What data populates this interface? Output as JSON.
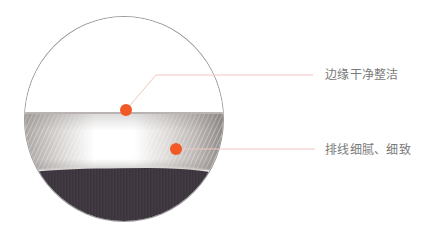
{
  "callouts": [
    {
      "label": "边缘干净整洁",
      "target": "lens-edge"
    },
    {
      "label": "排线细腻、细致",
      "target": "metal-band"
    }
  ],
  "colors": {
    "accent_dot": "#f15a24",
    "callout_line": "#f2c6c0",
    "label_text": "#7a7a7a",
    "fabric": "#3f3740",
    "lens_outline": "#9a9a9a"
  },
  "icons": {
    "marker": "orange-dot-marker"
  }
}
